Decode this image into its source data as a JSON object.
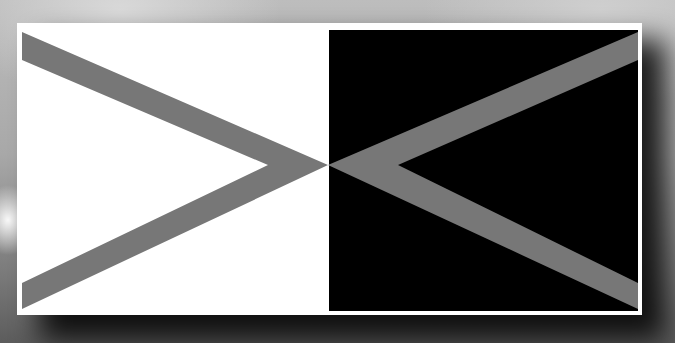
{
  "figure": {
    "colors": {
      "left_panel": "#ffffff",
      "right_panel": "#000000",
      "band": "#777777",
      "frame": "#ffffff",
      "background": "#a8a8a8"
    },
    "left_panel": {
      "x": 17,
      "y": 23,
      "width": 311,
      "height": 292
    },
    "right_panel": {
      "x": 329,
      "y": 30,
      "width": 309,
      "height": 281
    },
    "center": {
      "x": 328,
      "y": 165
    }
  }
}
